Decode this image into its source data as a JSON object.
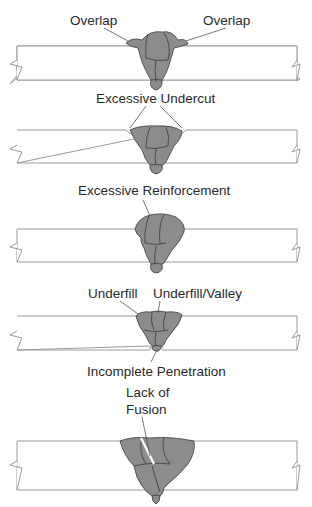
{
  "figure": {
    "panels": [
      {
        "id": "overlap",
        "labels": [
          "Overlap",
          "Overlap"
        ]
      },
      {
        "id": "undercut",
        "labels": [
          "Excessive Undercut"
        ]
      },
      {
        "id": "reinforcement",
        "labels": [
          "Excessive Reinforcement"
        ]
      },
      {
        "id": "underfill",
        "labels": [
          "Underfill",
          "Underfill/Valley",
          "Incomplete Penetration"
        ]
      },
      {
        "id": "fusion",
        "labels": [
          "Lack of",
          "Fusion"
        ]
      }
    ]
  },
  "colors": {
    "bead": "#8c8c8c",
    "bead_outline": "#3a3a3a",
    "plate_outline": "#9a9a9a",
    "text": "#2a2a2a"
  }
}
